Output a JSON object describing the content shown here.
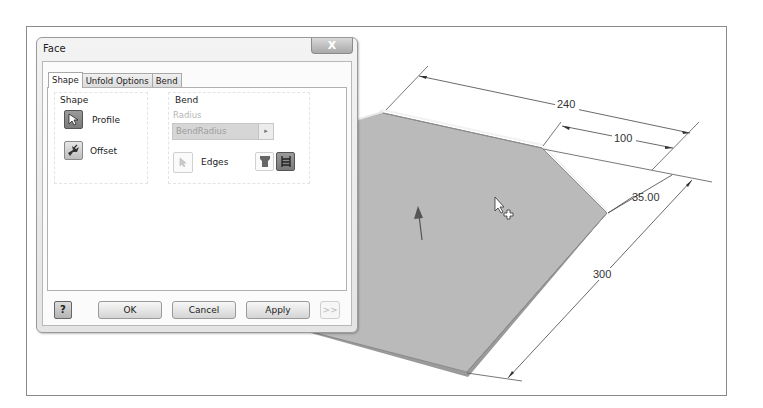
{
  "dialog": {
    "title": "Face",
    "close_label": "X",
    "tabs": [
      {
        "label": "Shape",
        "active": true
      },
      {
        "label": "Unfold Options",
        "active": false
      },
      {
        "label": "Bend",
        "active": false
      }
    ],
    "shape_group": {
      "label": "Shape",
      "profile": {
        "label": "Profile",
        "icon": "cursor-select-icon"
      },
      "offset": {
        "label": "Offset",
        "icon": "offset-flip-icon"
      }
    },
    "bend_group": {
      "label": "Bend",
      "radius_label": "Radius",
      "radius_value": "BendRadius",
      "radius_arrow": "▸",
      "edges": {
        "label": "Edges",
        "icon": "cursor-select-icon"
      },
      "edge_options": [
        {
          "name": "edge-mode-single",
          "pressed": false
        },
        {
          "name": "edge-mode-all",
          "pressed": true
        }
      ]
    },
    "footer": {
      "help": "?",
      "ok": "OK",
      "cancel": "Cancel",
      "apply": "Apply",
      "more": ">>"
    }
  },
  "viewport": {
    "part_color": "#b9b9b9",
    "dimensions": [
      {
        "name": "top-length",
        "value": "240"
      },
      {
        "name": "top-right-segment",
        "value": "100"
      },
      {
        "name": "chamfer-side",
        "value": "35.00"
      },
      {
        "name": "right-length",
        "value": "300"
      }
    ],
    "direction_arrow": "up",
    "cursor": "select-move-cursor"
  }
}
